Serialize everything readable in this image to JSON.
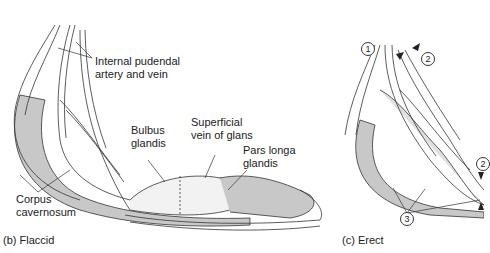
{
  "panel_b": {
    "caption": "(b)  Flaccid",
    "labels": {
      "internal_pudendal_1": "Internal pudendal",
      "internal_pudendal_2": "artery and vein",
      "bulbus_1": "Bulbus",
      "bulbus_2": "glandis",
      "superficial_1": "Superficial",
      "superficial_2": "vein of glans",
      "pars_longa_1": "Pars longa",
      "pars_longa_2": "glandis",
      "corpus_1": "Corpus",
      "corpus_2": "cavernosum"
    }
  },
  "panel_c": {
    "caption": "(c)  Erect",
    "markers": [
      "1",
      "2",
      "2",
      "3"
    ]
  },
  "colors": {
    "line": "#333333",
    "tissue_fill": "#c8c8c8",
    "background": "#ffffff"
  }
}
